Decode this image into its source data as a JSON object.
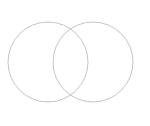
{
  "canvas": {
    "width": 150,
    "height": 126,
    "background_color": "#ffffff"
  },
  "diagram": {
    "type": "venn-two-set",
    "title": "",
    "caption": "",
    "stroke_color": "#bdbdbd",
    "stroke_width": 0.9,
    "fill": "none",
    "labels_visible": false
  },
  "chart_data": {
    "type": "diagram",
    "title": "",
    "xlabel": "",
    "ylabel": "",
    "shapes": [
      {
        "name": "left-circle",
        "label": "",
        "cx": 48,
        "cy": 62,
        "r": 40,
        "stroke": "#bdbdbd",
        "fill": "none"
      },
      {
        "name": "right-circle",
        "label": "",
        "cx": 93,
        "cy": 62,
        "r": 40,
        "stroke": "#bdbdbd",
        "fill": "none"
      }
    ],
    "intersection_points": [
      {
        "x": 77,
        "y": 27
      },
      {
        "x": 77,
        "y": 98
      }
    ],
    "legend": [],
    "annotations": []
  },
  "circles": {
    "left": {
      "name": "left-circle",
      "cx": "48",
      "cy": "62",
      "r": "40"
    },
    "right": {
      "name": "right-circle",
      "cx": "93",
      "cy": "62",
      "r": "40"
    }
  }
}
